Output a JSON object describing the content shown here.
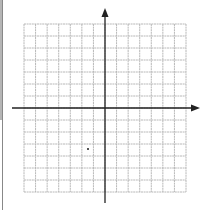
{
  "diagram": {
    "type": "coordinate-plane",
    "grid": {
      "columns": 14,
      "rows": 14,
      "left": 24,
      "top": 24,
      "right": 186,
      "bottom": 192,
      "line_color": "#b8b8b8"
    },
    "axes": {
      "x_axis_y": 108,
      "x_axis_start": 12,
      "x_axis_end": 200,
      "y_axis_x": 105,
      "y_axis_start": 8,
      "y_axis_end": 203,
      "color": "#222222"
    },
    "marks": [
      {
        "name": "stray-mark",
        "x": 88,
        "y": 149
      }
    ]
  }
}
